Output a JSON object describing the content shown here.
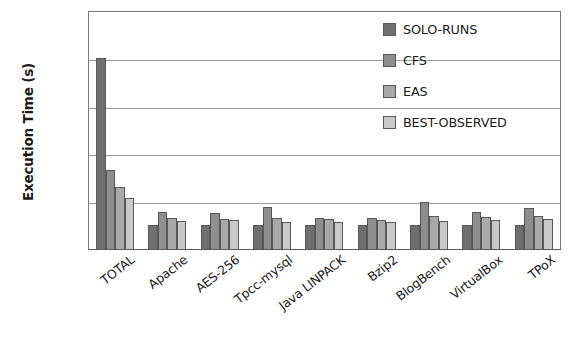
{
  "chart_data": {
    "type": "bar",
    "title": "",
    "xlabel": "",
    "ylabel": "Execution Time (s)",
    "ylim": [
      0,
      1000
    ],
    "ytick_values": [
      0,
      200,
      400,
      600,
      800,
      1000
    ],
    "ytick_labels": [
      "0",
      "200",
      "400",
      "600",
      "800",
      "1000"
    ],
    "grid": true,
    "legend_position": "top-right",
    "categories": [
      "TOTAL",
      "Apache",
      "AES-256",
      "Tpcc-mysql",
      "Java LINPACK",
      "Bzip2",
      "BlogBench",
      "VirtualBox",
      "TPoX"
    ],
    "series": [
      {
        "name": "SOLO-RUNS",
        "color": "#6f6f6f",
        "values": [
          800,
          100,
          100,
          100,
          100,
          100,
          100,
          100,
          100
        ]
      },
      {
        "name": "CFS",
        "color": "#8e8e8e",
        "values": [
          330,
          155,
          150,
          175,
          130,
          130,
          195,
          155,
          170
        ]
      },
      {
        "name": "EAS",
        "color": "#a9a9a9",
        "values": [
          258,
          130,
          125,
          128,
          125,
          122,
          140,
          132,
          140
        ]
      },
      {
        "name": "BEST-OBSERVED",
        "color": "#c9c9c9",
        "values": [
          213,
          118,
          122,
          115,
          115,
          112,
          118,
          120,
          125
        ]
      }
    ]
  }
}
